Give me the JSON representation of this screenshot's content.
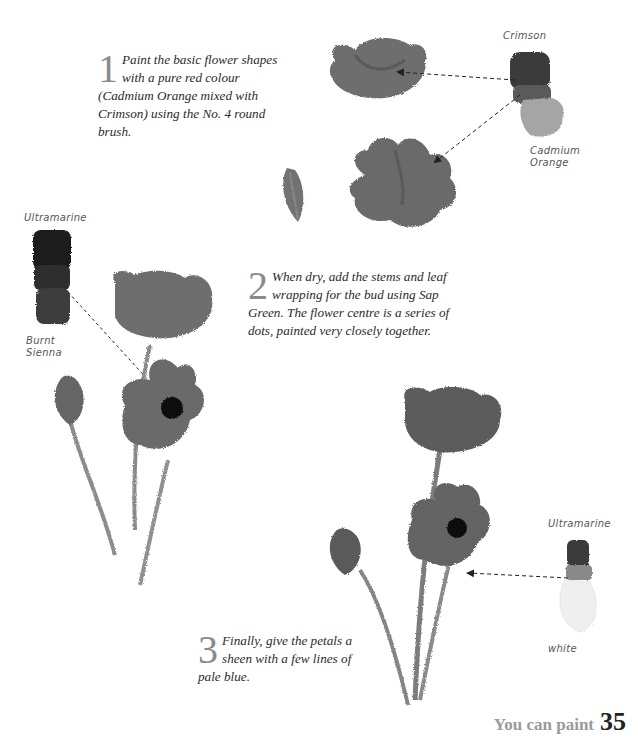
{
  "steps": [
    {
      "number": "1",
      "text": "Paint the basic flower shapes with a pure red colour (Cadmium Orange mixed with Crimson) using the No. 4 round brush."
    },
    {
      "number": "2",
      "text": "When dry, add the stems and leaf wrapping for the bud using Sap Green. The flower centre is a series of dots, painted very closely together."
    },
    {
      "number": "3",
      "text": "Finally, give the petals a sheen with a few lines of pale blue."
    }
  ],
  "swatch_labels": {
    "step1_top": "Crimson",
    "step1_bottom": "Cadmium Orange",
    "step2_top": "Ultramarine",
    "step2_bottom": "Burnt Sienna",
    "step3_top": "Ultramarine",
    "step3_bottom": "white"
  },
  "folio": {
    "running_title": "You can paint",
    "page_number": "35"
  },
  "colors": {
    "petal": "#6e6e6e",
    "petal_dark": "#555555",
    "centre": "#111111",
    "stem": "#8a8a8a"
  }
}
